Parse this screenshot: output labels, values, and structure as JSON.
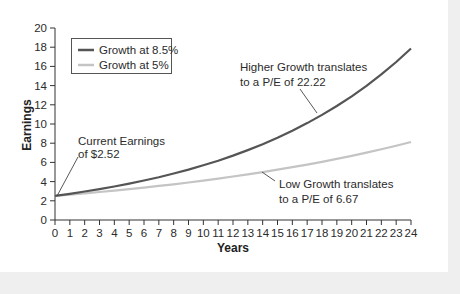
{
  "chart_data": {
    "type": "line",
    "title": "",
    "xlabel": "Years",
    "ylabel": "Earnings",
    "xlim": [
      0,
      24
    ],
    "ylim": [
      0,
      20
    ],
    "x_ticks": [
      0,
      1,
      2,
      3,
      4,
      5,
      6,
      7,
      8,
      9,
      10,
      11,
      12,
      13,
      14,
      15,
      16,
      17,
      18,
      19,
      20,
      21,
      22,
      23,
      24
    ],
    "y_ticks": [
      0,
      2,
      4,
      6,
      8,
      10,
      12,
      14,
      16,
      18,
      20
    ],
    "grid": false,
    "legend_position": "upper left",
    "x": [
      0,
      1,
      2,
      3,
      4,
      5,
      6,
      7,
      8,
      9,
      10,
      11,
      12,
      13,
      14,
      15,
      16,
      17,
      18,
      19,
      20,
      21,
      22,
      23,
      24
    ],
    "series": [
      {
        "name": "Growth at 8.5%",
        "color": "#555555",
        "growth_rate": 0.085,
        "values": [
          2.52,
          2.73,
          2.97,
          3.22,
          3.49,
          3.79,
          4.11,
          4.46,
          4.84,
          5.25,
          5.7,
          6.18,
          6.71,
          7.28,
          7.9,
          8.57,
          9.3,
          10.09,
          10.95,
          11.88,
          12.89,
          13.98,
          15.17,
          16.46,
          17.86
        ]
      },
      {
        "name": "Growth at 5%",
        "color": "#c4c4c4",
        "growth_rate": 0.05,
        "values": [
          2.52,
          2.65,
          2.78,
          2.92,
          3.06,
          3.22,
          3.38,
          3.55,
          3.72,
          3.91,
          4.1,
          4.31,
          4.53,
          4.75,
          4.99,
          5.24,
          5.5,
          5.77,
          6.06,
          6.37,
          6.69,
          7.02,
          7.37,
          7.74,
          8.13
        ]
      }
    ],
    "annotations": [
      {
        "lines": [
          "Current Earnings",
          "of $2.52"
        ],
        "x": 0,
        "y": 2.52
      },
      {
        "lines": [
          "Higher Growth translates",
          "to a P/E of 22.22"
        ],
        "x": 17.5,
        "y": 10.4
      },
      {
        "lines": [
          "Low Growth translates",
          "to a P/E of 6.67"
        ],
        "x": 14,
        "y": 5.0
      }
    ]
  }
}
